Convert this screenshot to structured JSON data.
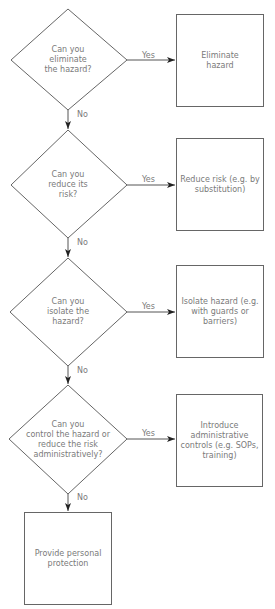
{
  "diagram": {
    "title": "",
    "colors": {
      "line": "#555555",
      "text": "#7a7a7a",
      "arrowhead": "#222222",
      "background": "#ffffff"
    },
    "decisions": [
      {
        "id": "q1",
        "label": "Can you\neliminate\nthe hazard?"
      },
      {
        "id": "q2",
        "label": "Can you\nreduce its\nrisk?"
      },
      {
        "id": "q3",
        "label": "Can you\nisolate the\nhazard?"
      },
      {
        "id": "q4",
        "label": "Can you\ncontrol the hazard or\nreduce the risk\nadministratively?"
      }
    ],
    "actions": [
      {
        "id": "a1",
        "label": "Eliminate\nhazard"
      },
      {
        "id": "a2",
        "label": "Reduce risk (e.g. by\nsubstitution)"
      },
      {
        "id": "a3",
        "label": "Isolate hazard (e.g.\nwith guards or\nbarriers)"
      },
      {
        "id": "a4",
        "label": "Introduce\nadministrative\ncontrols (e.g. SOPs,\ntraining)"
      },
      {
        "id": "a5",
        "label": "Provide personal\nprotection"
      }
    ],
    "edges": [
      {
        "from": "q1",
        "to": "a1",
        "label": "Yes"
      },
      {
        "from": "q1",
        "to": "q2",
        "label": "No"
      },
      {
        "from": "q2",
        "to": "a2",
        "label": "Yes"
      },
      {
        "from": "q2",
        "to": "q3",
        "label": "No"
      },
      {
        "from": "q3",
        "to": "a3",
        "label": "Yes"
      },
      {
        "from": "q3",
        "to": "q4",
        "label": "No"
      },
      {
        "from": "q4",
        "to": "a4",
        "label": "Yes"
      },
      {
        "from": "q4",
        "to": "a5",
        "label": "No"
      }
    ]
  }
}
